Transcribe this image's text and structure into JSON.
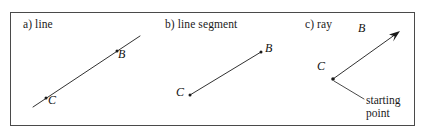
{
  "figure": {
    "background_color": "#ffffff",
    "border_color": "#4a4a4a",
    "ink_color": "#1a1a1a"
  },
  "panels": [
    {
      "id": "line",
      "caption": "a) line",
      "points": [
        {
          "name": "B",
          "label": "B"
        },
        {
          "name": "C",
          "label": "C"
        }
      ]
    },
    {
      "id": "line-segment",
      "caption": "b) line segment",
      "points": [
        {
          "name": "B",
          "label": "B"
        },
        {
          "name": "C",
          "label": "C"
        }
      ]
    },
    {
      "id": "ray",
      "caption": "c) ray",
      "points": [
        {
          "name": "B",
          "label": "B"
        },
        {
          "name": "C",
          "label": "C"
        }
      ],
      "annotation": {
        "line1": "starting",
        "line2": "point"
      }
    }
  ]
}
